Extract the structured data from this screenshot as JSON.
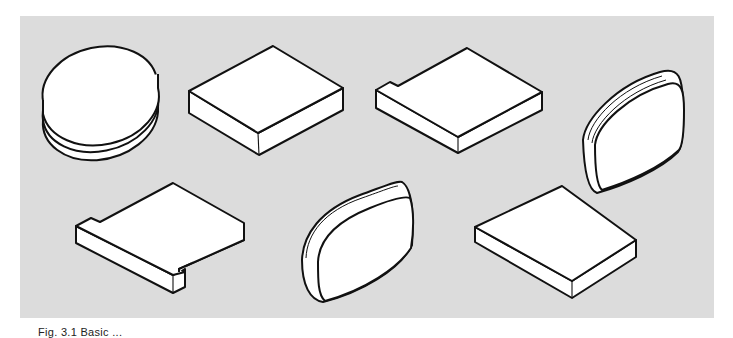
{
  "figure": {
    "caption": "Fig. 3.1  Basic ...",
    "background_color": "#dcdcdc",
    "shapes": [
      {
        "id": "oval-disc",
        "label": "oval disc"
      },
      {
        "id": "square-block",
        "label": "square block"
      },
      {
        "id": "notched-block",
        "label": "block with corner notch"
      },
      {
        "id": "cushion-upright",
        "label": "rounded cushion (upright)"
      },
      {
        "id": "stepped-slab",
        "label": "slab with two notches"
      },
      {
        "id": "cushion-tilted",
        "label": "rounded cushion (tilted)"
      },
      {
        "id": "flat-square",
        "label": "flat square block"
      }
    ]
  }
}
